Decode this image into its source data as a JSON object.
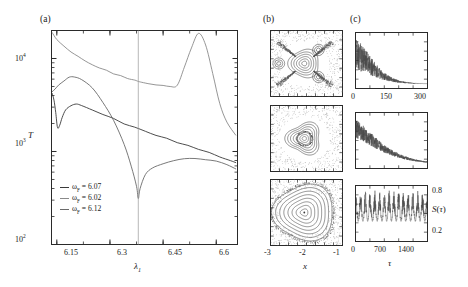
{
  "figure": {
    "panels": [
      {
        "tag": "(a)"
      },
      {
        "tag": "(b)"
      },
      {
        "tag": "(c)"
      }
    ]
  },
  "panel_a": {
    "tag": "(a)",
    "ylabel": "T",
    "xlabel_base": "λ",
    "xlabel_sub": "1",
    "ytick_labels": [
      "10",
      "10",
      "10"
    ],
    "ytick_exponents": [
      "2",
      "3",
      "4"
    ],
    "xtick_labels": [
      "6.15",
      "6.3",
      "6.45",
      "6.6"
    ],
    "legend": [
      {
        "symbol": "ω",
        "sub": "F",
        "eq": "= 6.07",
        "color": "#3a3a3a"
      },
      {
        "symbol": "ω",
        "sub": "F",
        "eq": "= 6.02",
        "color": "#8a8a8a"
      },
      {
        "symbol": "ω",
        "sub": "F",
        "eq": "= 6.12",
        "color": "#6a6a6a"
      }
    ],
    "marker_line_x": 6.38
  },
  "panel_b": {
    "tag": "(b)",
    "xlabel": "x",
    "xtick_labels": [
      "-3",
      "-2",
      "-1"
    ],
    "sections": [
      "poincare-top",
      "poincare-middle",
      "poincare-bottom"
    ]
  },
  "panel_c": {
    "tag": "(c)",
    "xlabel": "τ",
    "ylabel": "S(τ)",
    "ytick_labels": [
      "0.8",
      "0.2"
    ],
    "xtick_labels_top": [
      "0",
      "150",
      "300"
    ],
    "xtick_labels_bottom": [
      "0",
      "700",
      "1400"
    ],
    "series": [
      "decay-fast",
      "decay-slow",
      "sustained-noise"
    ]
  },
  "chart_data": {
    "type": "line",
    "title": "",
    "xlabel": "λ₁",
    "ylabel": "T",
    "xlim": [
      6.135,
      6.66
    ],
    "ylim": [
      100,
      20000
    ],
    "yscale": "log",
    "grid": false,
    "legend_position": "lower-left",
    "xticks": [
      6.15,
      6.3,
      6.45,
      6.6
    ],
    "yticks": [
      100,
      1000,
      10000
    ],
    "annotations": [
      {
        "type": "vline",
        "x": 6.38
      }
    ],
    "series": [
      {
        "name": "ωF = 6.02",
        "color": "#8a8a8a",
        "x": [
          6.137,
          6.15,
          6.17,
          6.19,
          6.21,
          6.23,
          6.25,
          6.27,
          6.29,
          6.31,
          6.33,
          6.35,
          6.37,
          6.38,
          6.39,
          6.41,
          6.43,
          6.45,
          6.47,
          6.49,
          6.51,
          6.53,
          6.55,
          6.57,
          6.59,
          6.61,
          6.63,
          6.655
        ],
        "y": [
          19000,
          16000,
          13500,
          11800,
          10500,
          9400,
          8600,
          7900,
          7400,
          6900,
          6500,
          6100,
          5800,
          5650,
          5550,
          5400,
          5250,
          5150,
          5000,
          5200,
          8000,
          13000,
          18500,
          14000,
          7000,
          3300,
          2100,
          1500
        ]
      },
      {
        "name": "ωF = 6.07",
        "color": "#3a3a3a",
        "x": [
          6.137,
          6.142,
          6.147,
          6.152,
          6.158,
          6.165,
          6.175,
          6.19,
          6.205,
          6.22,
          6.25,
          6.28,
          6.31,
          6.34,
          6.37,
          6.4,
          6.43,
          6.46,
          6.49,
          6.52,
          6.55,
          6.58,
          6.61,
          6.64,
          6.655
        ],
        "y": [
          4200,
          3600,
          2600,
          1800,
          1900,
          2300,
          2800,
          3100,
          3200,
          3150,
          2800,
          2500,
          2250,
          2000,
          1800,
          1650,
          1500,
          1380,
          1250,
          1150,
          1060,
          980,
          880,
          800,
          760
        ]
      },
      {
        "name": "ωF = 6.12",
        "color": "#6a6a6a",
        "x": [
          6.137,
          6.145,
          6.155,
          6.17,
          6.185,
          6.2,
          6.22,
          6.25,
          6.28,
          6.31,
          6.34,
          6.36,
          6.375,
          6.38,
          6.385,
          6.4,
          6.42,
          6.45,
          6.48,
          6.51,
          6.54,
          6.57,
          6.6,
          6.63,
          6.655
        ],
        "y": [
          4400,
          4700,
          5200,
          5700,
          6200,
          6300,
          6000,
          4800,
          3400,
          2200,
          1200,
          700,
          420,
          310,
          400,
          560,
          660,
          740,
          800,
          830,
          840,
          820,
          790,
          720,
          650
        ]
      }
    ]
  }
}
